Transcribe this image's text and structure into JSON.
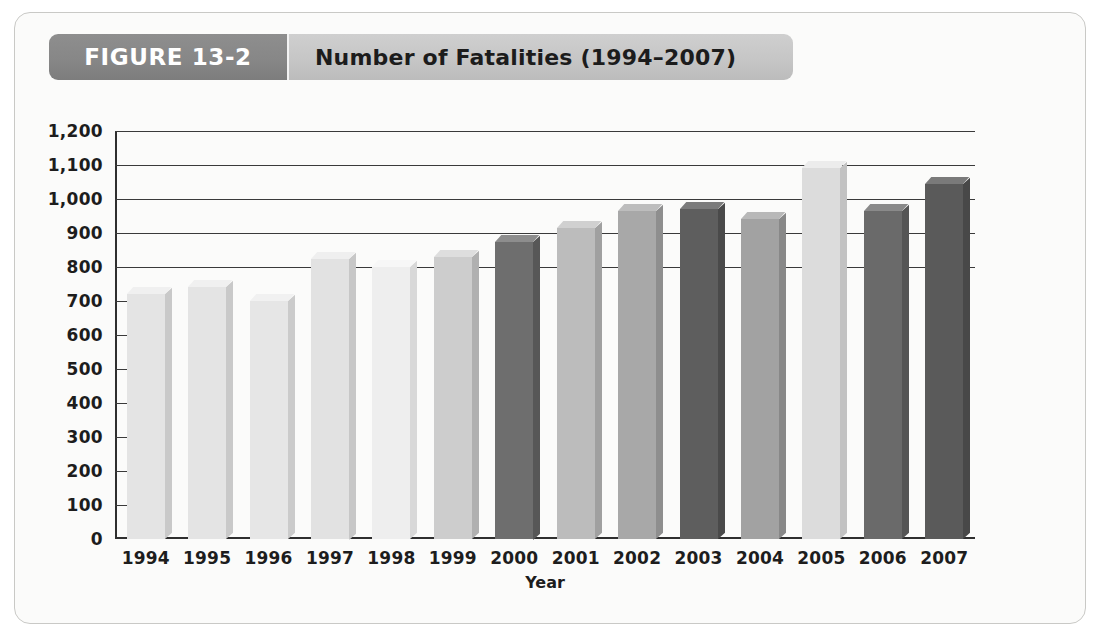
{
  "figure": {
    "tab_label": "FIGURE 13-2",
    "title": "Number of Fatalities (1994–2007)"
  },
  "chart_data": {
    "type": "bar",
    "title": "Number of Fatalities (1994–2007)",
    "xlabel": "Year",
    "ylabel": "",
    "ylim": [
      0,
      1200
    ],
    "ystep": 100,
    "grid": true,
    "legend": "none",
    "categories": [
      "1994",
      "1995",
      "1996",
      "1997",
      "1998",
      "1999",
      "2000",
      "2001",
      "2002",
      "2003",
      "2004",
      "2005",
      "2006",
      "2007"
    ],
    "ytick_labels": [
      "0",
      "100",
      "200",
      "300",
      "400",
      "500",
      "600",
      "700",
      "800",
      "900",
      "1,000",
      "1,100",
      "1,200"
    ],
    "values": [
      720,
      740,
      700,
      825,
      800,
      830,
      875,
      915,
      965,
      970,
      940,
      1090,
      965,
      1045
    ],
    "bar_colors": [
      "#e4e4e4",
      "#e4e4e4",
      "#e6e6e6",
      "#e2e2e2",
      "#eeeeee",
      "#cdcdcd",
      "#6e6e6e",
      "#bcbcbc",
      "#a8a8a8",
      "#5e5e5e",
      "#a2a2a2",
      "#dcdcdc",
      "#6a6a6a",
      "#5a5a5a"
    ],
    "bar_top_colors": [
      "#f0f0f0",
      "#f0f0f0",
      "#f1f1f1",
      "#efefef",
      "#f7f7f7",
      "#dedede",
      "#8d8d8d",
      "#d0d0d0",
      "#bdbdbd",
      "#7b7b7b",
      "#b8b8b8",
      "#ececec",
      "#8a8a8a",
      "#7a7a7a"
    ],
    "bar_side_colors": [
      "#c9c9c9",
      "#c9c9c9",
      "#cbcbcb",
      "#c7c7c7",
      "#d8d8d8",
      "#b0b0b0",
      "#575757",
      "#a0a0a0",
      "#8e8e8e",
      "#4a4a4a",
      "#888888",
      "#c2c2c2",
      "#555555",
      "#484848"
    ]
  },
  "colors": {
    "panel_bg": "#fbfbfa",
    "panel_border": "#c9c9c6",
    "tab_dark": "#878787",
    "tab_light": "#c6c6c6",
    "axis": "#2f2f2f",
    "text": "#1d1d1d"
  }
}
